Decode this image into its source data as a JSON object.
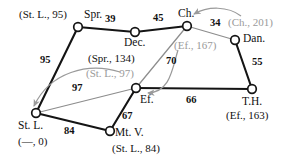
{
  "diagram": {
    "colors": {
      "edge": "#141414",
      "node_stroke": "#141414",
      "node_fill": "#ffffff",
      "relax_arrow": "#9a9a9a",
      "text": "#111111",
      "text_dim": "#9a9a9a",
      "background": "#ffffff"
    },
    "nodes": [
      {
        "id": "spr",
        "label": "Spr.",
        "x": 78,
        "y": 27,
        "pair": "(St. L., 95)",
        "pair_dim": false
      },
      {
        "id": "dec",
        "label": "Dec.",
        "x": 135,
        "y": 32,
        "pair": "(Spr., 134)",
        "pair_dim": false
      },
      {
        "id": "ch",
        "label": "Ch.",
        "x": 187,
        "y": 26,
        "pair": "(Ch., 201)",
        "pair_dim": true
      },
      {
        "id": "dan",
        "label": "Dan.",
        "x": 235,
        "y": 40,
        "pair": "",
        "pair_dim": false
      },
      {
        "id": "th",
        "label": "T.H.",
        "x": 252,
        "y": 89,
        "pair": "(Ef., 163)",
        "pair_dim": false
      },
      {
        "id": "ef",
        "label": "Ef.",
        "x": 136,
        "y": 88,
        "pair": "(Ef., 167)",
        "pair_dim": true
      },
      {
        "id": "stl",
        "label": "St. L.",
        "x": 36,
        "y": 113,
        "pair": "(—, 0)",
        "pair_dim": false
      },
      {
        "id": "mtv",
        "label": "Mt. V.",
        "x": 110,
        "y": 131,
        "pair": "(St. L., 84)",
        "pair_dim": false
      }
    ],
    "edges": [
      {
        "from": "spr",
        "to": "dec",
        "weight": "39"
      },
      {
        "from": "dec",
        "to": "ch",
        "weight": "45"
      },
      {
        "from": "ch",
        "to": "dan",
        "weight": "34"
      },
      {
        "from": "dan",
        "to": "th",
        "weight": "55"
      },
      {
        "from": "ch",
        "to": "ef",
        "weight": "70"
      },
      {
        "from": "ef",
        "to": "th",
        "weight": "66"
      },
      {
        "from": "spr",
        "to": "stl",
        "weight": "95"
      },
      {
        "from": "stl",
        "to": "ef",
        "weight": "97"
      },
      {
        "from": "stl",
        "to": "mtv",
        "weight": "84"
      },
      {
        "from": "mtv",
        "to": "ef",
        "weight": "67"
      }
    ],
    "node_labels": {
      "spr": "Spr.",
      "dec": "Dec.",
      "ch": "Ch.",
      "dan": "Dan.",
      "th": "T.H.",
      "ef": "Ef.",
      "stl": "St. L.",
      "mtv": "Mt. V."
    },
    "pairs": {
      "spr": "(St. L., 95)",
      "dec": "(Spr., 134)",
      "ch": "(Ch., 201)",
      "th": "(Ef., 163)",
      "ef": "(Ef., 167)",
      "stl": "(—, 0)",
      "mtv": "(St. L., 84)",
      "stl_relax": "(St. L., 97)"
    },
    "weights": {
      "spr_dec": "39",
      "dec_ch": "45",
      "ch_dan": "34",
      "dan_th": "55",
      "ch_ef": "70",
      "ef_th": "66",
      "spr_stl": "95",
      "stl_ef": "97",
      "stl_mtv": "84",
      "mtv_ef": "67"
    },
    "relax_arrows": [
      {
        "id": "arrow-to-ch",
        "from_label": "(Ch., 201)",
        "to_node": "ch"
      },
      {
        "id": "arrow-to-ef",
        "from_label": "(Ef., 167)",
        "to_node": "ef"
      },
      {
        "id": "arrow-to-stl",
        "from_label": "(St. L., 97)",
        "to_node": "stl"
      }
    ]
  }
}
